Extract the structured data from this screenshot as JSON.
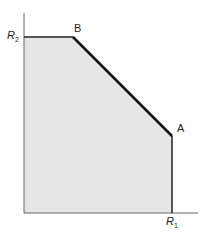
{
  "diagram": {
    "type": "capacity-region",
    "labels": {
      "y_axis": "R",
      "y_axis_sub": "2",
      "x_axis": "R",
      "x_axis_sub": "1",
      "point_a": "A",
      "point_b": "B"
    },
    "colors": {
      "fill": "#e6e6e6",
      "axis": "#555555",
      "boundary": "#111111"
    }
  }
}
